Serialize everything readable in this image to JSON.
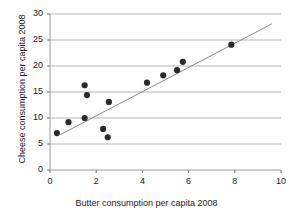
{
  "chart_data": {
    "type": "scatter",
    "title": "",
    "xlabel": "Butter consumption per capita 2008",
    "ylabel": "Cheese consumption per capita 2008",
    "xlim": [
      0,
      10
    ],
    "ylim": [
      0,
      30
    ],
    "xticks": [
      0,
      2,
      4,
      6,
      8,
      10
    ],
    "yticks": [
      0,
      5,
      10,
      15,
      20,
      25,
      30
    ],
    "xtick_labels": [
      "0",
      "2",
      "4",
      "6",
      "8",
      "10"
    ],
    "ytick_labels": [
      "0",
      "5",
      "10",
      "15",
      "20",
      "25",
      "30"
    ],
    "grid": "horizontal",
    "legend": "none",
    "series": [
      {
        "name": "countries",
        "marker": "filled-circle",
        "color": "#2b2b2b",
        "points": [
          {
            "x": 0.3,
            "y": 7.1
          },
          {
            "x": 0.8,
            "y": 9.2
          },
          {
            "x": 1.5,
            "y": 10.0
          },
          {
            "x": 1.5,
            "y": 16.3
          },
          {
            "x": 1.6,
            "y": 14.4
          },
          {
            "x": 2.3,
            "y": 7.9
          },
          {
            "x": 2.5,
            "y": 6.3
          },
          {
            "x": 2.55,
            "y": 13.1
          },
          {
            "x": 4.2,
            "y": 16.8
          },
          {
            "x": 4.9,
            "y": 18.2
          },
          {
            "x": 5.5,
            "y": 19.2
          },
          {
            "x": 5.75,
            "y": 20.8
          },
          {
            "x": 7.85,
            "y": 24.1
          }
        ]
      }
    ],
    "trendline": {
      "name": "linear fit",
      "color": "#8a8a8a",
      "x_start": 0.45,
      "y_start": 6.8,
      "x_end": 9.6,
      "y_end": 28.1
    }
  }
}
